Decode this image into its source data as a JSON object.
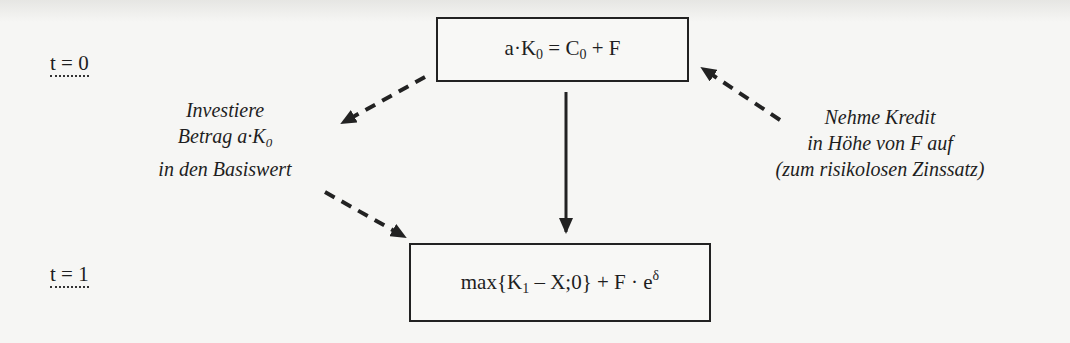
{
  "diagram": {
    "type": "payoff-replication-flow",
    "time_labels": {
      "t0": "t = 0",
      "t1": "t = 1"
    },
    "top_box": {
      "parts": [
        "a·K",
        "0",
        " = C",
        "0",
        " + F"
      ]
    },
    "bottom_box": {
      "parts": [
        "max{K",
        "1",
        " – X;0} + F · e",
        "δ"
      ]
    },
    "left_note": {
      "line1": "Investiere",
      "line2_prefix": "Betrag a·K",
      "line2_sub": "0",
      "line3": "in den Basiswert"
    },
    "right_note": {
      "line1": "Nehme Kredit",
      "line2": "in Höhe von F auf",
      "line3": "(zum risikolosen Zinssatz)"
    },
    "arrows": [
      {
        "id": "invest-out",
        "style": "dashed",
        "from": [
          425,
          77
        ],
        "to": [
          340,
          124
        ]
      },
      {
        "id": "invest-in",
        "style": "dashed",
        "from": [
          325,
          192
        ],
        "to": [
          407,
          238
        ]
      },
      {
        "id": "credit",
        "style": "dashed",
        "from": [
          780,
          120
        ],
        "to": [
          700,
          67
        ]
      },
      {
        "id": "time-flow",
        "style": "solid",
        "from": [
          566,
          92
        ],
        "to": [
          566,
          232
        ]
      }
    ],
    "colors": {
      "line": "#222222",
      "background": "#f6f6f4"
    }
  }
}
